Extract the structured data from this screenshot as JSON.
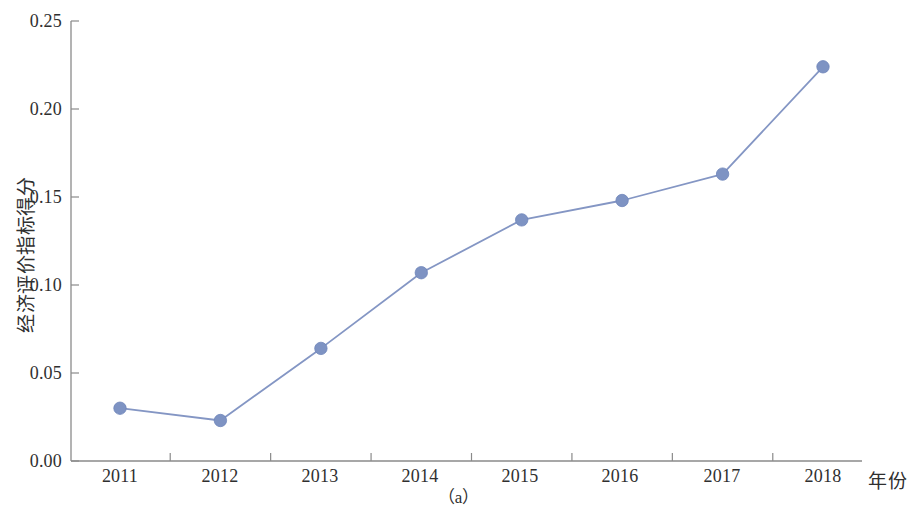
{
  "chart_data": {
    "type": "line",
    "title": "",
    "subtitle": "",
    "caption": "（a）",
    "xlabel": "年份",
    "ylabel": "经济评价指标得分",
    "categories": [
      "2011",
      "2012",
      "2013",
      "2014",
      "2015",
      "2016",
      "2017",
      "2018"
    ],
    "x": [
      2011,
      2012,
      2013,
      2014,
      2015,
      2016,
      2017,
      2018
    ],
    "values": [
      0.03,
      0.023,
      0.064,
      0.107,
      0.137,
      0.148,
      0.163,
      0.224
    ],
    "series": [
      {
        "name": "经济评价指标得分",
        "values": [
          0.03,
          0.023,
          0.064,
          0.107,
          0.137,
          0.148,
          0.163,
          0.224
        ]
      }
    ],
    "ylim": [
      0.0,
      0.25
    ],
    "ytick_values": [
      0.0,
      0.05,
      0.1,
      0.15,
      0.2,
      0.25
    ],
    "ytick_labels": [
      "0.00",
      "0.05",
      "0.10",
      "0.15",
      "0.20",
      "0.25"
    ],
    "xtick_labels": [
      "2011",
      "2012",
      "2013",
      "2014",
      "2015",
      "2016",
      "2017",
      "2018"
    ],
    "grid": false,
    "legend": null,
    "legend_position": "none",
    "marker": "circle",
    "colors": {
      "line": "#8496c4",
      "marker": "#7e93c3",
      "marker_edge": "#6f85ba",
      "axis": "#8a8a8a",
      "text": "#2f2f2f",
      "background": "#ffffff"
    }
  }
}
